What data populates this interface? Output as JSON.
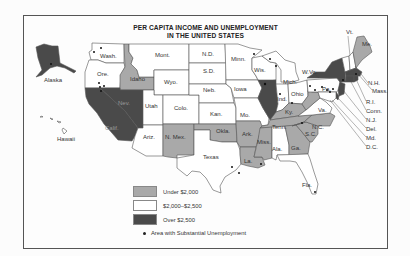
{
  "title": {
    "line1": "PER CAPITA INCOME AND UNEMPLOYMENT",
    "line2": "IN THE UNITED STATES"
  },
  "colors": {
    "under_2000": "#a9a9a9",
    "mid_2000_2500": "#ffffff",
    "over_2500": "#4a4a4a",
    "border": "#555555",
    "dot": "#111111"
  },
  "legend": {
    "items": [
      {
        "label": "Under $2,000",
        "category": "under_2000"
      },
      {
        "label": "$2,000–$2,500",
        "category": "mid_2000_2500"
      },
      {
        "label": "Over $2,500",
        "category": "over_2500"
      }
    ],
    "dot_label": "Area with Substantial Unemployment"
  },
  "states": [
    {
      "abbr": "Alaska",
      "category": "over_2500",
      "unemployment_dots": 1
    },
    {
      "abbr": "Hawaii",
      "category": "mid_2000_2500",
      "unemployment_dots": 0
    },
    {
      "abbr": "Wash.",
      "category": "mid_2000_2500",
      "unemployment_dots": 2
    },
    {
      "abbr": "Ore.",
      "category": "mid_2000_2500",
      "unemployment_dots": 0
    },
    {
      "abbr": "Calif.",
      "category": "over_2500",
      "unemployment_dots": 4
    },
    {
      "abbr": "Nev.",
      "category": "over_2500",
      "unemployment_dots": 0
    },
    {
      "abbr": "Idaho",
      "category": "under_2000",
      "unemployment_dots": 0
    },
    {
      "abbr": "Mont.",
      "category": "mid_2000_2500",
      "unemployment_dots": 0
    },
    {
      "abbr": "Wyo.",
      "category": "mid_2000_2500",
      "unemployment_dots": 0
    },
    {
      "abbr": "Utah",
      "category": "mid_2000_2500",
      "unemployment_dots": 0
    },
    {
      "abbr": "Colo.",
      "category": "mid_2000_2500",
      "unemployment_dots": 0
    },
    {
      "abbr": "Ariz.",
      "category": "mid_2000_2500",
      "unemployment_dots": 0
    },
    {
      "abbr": "N. Mex.",
      "category": "under_2000",
      "unemployment_dots": 0
    },
    {
      "abbr": "N.D.",
      "category": "mid_2000_2500",
      "unemployment_dots": 0
    },
    {
      "abbr": "S.D.",
      "category": "mid_2000_2500",
      "unemployment_dots": 0
    },
    {
      "abbr": "Neb.",
      "category": "mid_2000_2500",
      "unemployment_dots": 0
    },
    {
      "abbr": "Kan.",
      "category": "mid_2000_2500",
      "unemployment_dots": 0
    },
    {
      "abbr": "Okla.",
      "category": "under_2000",
      "unemployment_dots": 0
    },
    {
      "abbr": "Texas",
      "category": "mid_2000_2500",
      "unemployment_dots": 2
    },
    {
      "abbr": "Minn.",
      "category": "mid_2000_2500",
      "unemployment_dots": 1
    },
    {
      "abbr": "Iowa",
      "category": "mid_2000_2500",
      "unemployment_dots": 0
    },
    {
      "abbr": "Mo.",
      "category": "mid_2000_2500",
      "unemployment_dots": 0
    },
    {
      "abbr": "Ark.",
      "category": "under_2000",
      "unemployment_dots": 0
    },
    {
      "abbr": "La.",
      "category": "under_2000",
      "unemployment_dots": 1
    },
    {
      "abbr": "Wis.",
      "category": "mid_2000_2500",
      "unemployment_dots": 2
    },
    {
      "abbr": "Ill.",
      "category": "over_2500",
      "unemployment_dots": 1
    },
    {
      "abbr": "Mich.",
      "category": "mid_2000_2500",
      "unemployment_dots": 0
    },
    {
      "abbr": "Ind.",
      "category": "mid_2000_2500",
      "unemployment_dots": 1
    },
    {
      "abbr": "Ohio",
      "category": "mid_2000_2500",
      "unemployment_dots": 1
    },
    {
      "abbr": "Ky.",
      "category": "under_2000",
      "unemployment_dots": 0
    },
    {
      "abbr": "Tenn.",
      "category": "under_2000",
      "unemployment_dots": 1
    },
    {
      "abbr": "Miss.",
      "category": "under_2000",
      "unemployment_dots": 0
    },
    {
      "abbr": "Ala.",
      "category": "mid_2000_2500",
      "unemployment_dots": 0
    },
    {
      "abbr": "Ga.",
      "category": "under_2000",
      "unemployment_dots": 0
    },
    {
      "abbr": "Fla.",
      "category": "mid_2000_2500",
      "unemployment_dots": 1
    },
    {
      "abbr": "S.C.",
      "category": "under_2000",
      "unemployment_dots": 0
    },
    {
      "abbr": "N.C.",
      "category": "under_2000",
      "unemployment_dots": 0
    },
    {
      "abbr": "Va.",
      "category": "mid_2000_2500",
      "unemployment_dots": 0
    },
    {
      "abbr": "W.Va.",
      "category": "under_2000",
      "unemployment_dots": 0
    },
    {
      "abbr": "Pa.",
      "category": "mid_2000_2500",
      "unemployment_dots": 6
    },
    {
      "abbr": "N.Y.",
      "category": "over_2500",
      "unemployment_dots": 1
    },
    {
      "abbr": "Vt.",
      "category": "mid_2000_2500",
      "unemployment_dots": 0
    },
    {
      "abbr": "N.H.",
      "category": "mid_2000_2500",
      "unemployment_dots": 0
    },
    {
      "abbr": "Me.",
      "category": "under_2000",
      "unemployment_dots": 0
    },
    {
      "abbr": "Mass.",
      "category": "over_2500",
      "unemployment_dots": 1
    },
    {
      "abbr": "R.I.",
      "category": "over_2500",
      "unemployment_dots": 1
    },
    {
      "abbr": "Conn.",
      "category": "over_2500",
      "unemployment_dots": 0
    },
    {
      "abbr": "N.J.",
      "category": "over_2500",
      "unemployment_dots": 0
    },
    {
      "abbr": "Del.",
      "category": "over_2500",
      "unemployment_dots": 0
    },
    {
      "abbr": "Md.",
      "category": "mid_2000_2500",
      "unemployment_dots": 0
    },
    {
      "abbr": "D.C.",
      "category": "over_2500",
      "unemployment_dots": 0
    }
  ]
}
